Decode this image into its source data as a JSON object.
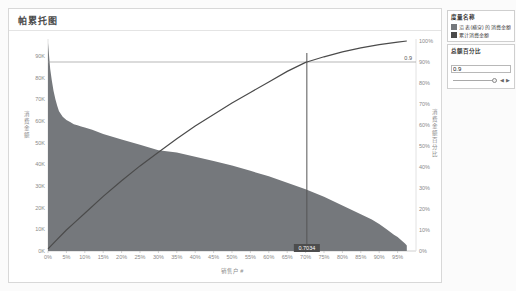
{
  "title": "帕累托图",
  "legend": {
    "title": "度量名称",
    "items": [
      {
        "label": "沿 表(横穿) 的 消费金额",
        "color": "#75787c"
      },
      {
        "label": "累计消费金额",
        "color": "#4b4b4b"
      }
    ]
  },
  "parameter": {
    "title": "总额百分比",
    "value": "0.9"
  },
  "chart_data": {
    "type": "pareto (bar area + cumulative line)",
    "title": "帕累托图",
    "colors": {
      "bar": "#75787c",
      "line": "#4b4b4b",
      "ref_line": "#9a9a9a",
      "ref_line_v": "#555555",
      "badge_bg": "#4d4d4d",
      "badge_text": "#ffffff",
      "axis_text": "#8a8a8a"
    },
    "x_axis": {
      "label": "销售户 #",
      "ticks": [
        "0%",
        "5%",
        "10%",
        "15%",
        "20%",
        "25%",
        "30%",
        "35%",
        "40%",
        "45%",
        "50%",
        "55%",
        "60%",
        "65%",
        "70%",
        "75%",
        "80%",
        "85%",
        "90%",
        "95%"
      ],
      "range": [
        0,
        100
      ]
    },
    "y_left": {
      "label": "消费金额",
      "ticks": [
        "0K",
        "10K",
        "20K",
        "30K",
        "40K",
        "50K",
        "60K",
        "70K",
        "80K",
        "90K"
      ],
      "range_k": [
        0,
        96
      ]
    },
    "y_right": {
      "label": "消费金额百分比",
      "ticks": [
        "0%",
        "10%",
        "20%",
        "30%",
        "40%",
        "50%",
        "60%",
        "70%",
        "80%",
        "90%",
        "100%"
      ],
      "range": [
        0,
        100
      ]
    },
    "bars": {
      "x_pct": [
        0,
        0.3,
        0.6,
        1,
        1.5,
        2,
        2.5,
        3,
        4,
        5,
        6,
        7,
        8,
        9,
        10,
        12,
        15,
        20,
        25,
        30,
        35,
        40,
        45,
        50,
        55,
        60,
        65,
        70,
        75,
        80,
        85,
        88,
        90,
        92,
        94,
        95,
        96,
        97,
        97.5
      ],
      "value_k": [
        96,
        90,
        84,
        79,
        74,
        70,
        67,
        64.5,
        62,
        60.5,
        59.5,
        58.5,
        58,
        57.5,
        57,
        56,
        54,
        51.5,
        49,
        46.5,
        45.5,
        43.5,
        41.5,
        39.5,
        37,
        34.5,
        31.5,
        28.5,
        25,
        21,
        17,
        14.5,
        12.5,
        10,
        7.5,
        6.5,
        5,
        3.5,
        2.5
      ]
    },
    "line": {
      "x_pct": [
        0,
        2.5,
        5,
        7.5,
        10,
        15,
        20,
        25,
        30,
        35,
        40,
        45,
        50,
        55,
        60,
        65,
        70,
        70.34,
        75,
        80,
        85,
        90,
        95,
        97.5
      ],
      "cum_pct": [
        1,
        5.5,
        10,
        14,
        18,
        26,
        33.5,
        40.5,
        47,
        53.5,
        59.5,
        65,
        70.5,
        75.5,
        80.5,
        85.5,
        89.8,
        90,
        92.5,
        94.8,
        96.7,
        98.3,
        99.5,
        100
      ]
    },
    "ref_h_pct": 90,
    "ref_h_label": "0.9",
    "ref_v_pct": 70.34,
    "ref_v_label": "0.7034"
  }
}
